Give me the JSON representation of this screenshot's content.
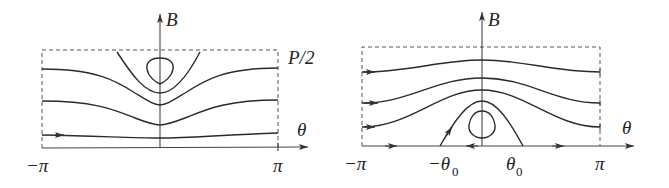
{
  "panels": [
    {
      "id": "left",
      "labels": {
        "y_axis": "B",
        "x_axis": "θ",
        "top_right": "P/2",
        "x_min": "−π",
        "x_max": "π"
      }
    },
    {
      "id": "right",
      "labels": {
        "y_axis": "B",
        "x_axis": "θ",
        "x_min": "−π",
        "x_max": "π",
        "neg_theta0": "−θ",
        "neg_theta0_sub": "0",
        "pos_theta0": "θ",
        "pos_theta0_sub": "0"
      }
    }
  ],
  "colors": {
    "stroke": "#2a2a2a",
    "background": "#ffffff"
  }
}
